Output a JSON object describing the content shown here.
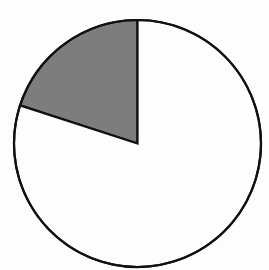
{
  "chart_data": {
    "type": "pie",
    "title": "",
    "start_angle_deg": 90,
    "direction": "counterclockwise",
    "slices": [
      {
        "label": "",
        "value": 20,
        "color": "#7d7d7d"
      },
      {
        "label": "",
        "value": 80,
        "color": "#fdfdfd"
      }
    ],
    "values": [
      20,
      80
    ],
    "categories": [
      "",
      ""
    ],
    "legend": false,
    "stroke_color": "#111111"
  }
}
